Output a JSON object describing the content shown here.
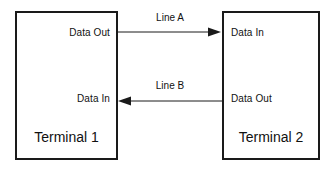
{
  "diagram": {
    "title_text": "",
    "background_color": "#ffffff",
    "stroke_color": "#1a1a1a",
    "terminals": [
      {
        "id": "terminal-1",
        "title": "Terminal 1",
        "ports": [
          {
            "id": "t1-data-out",
            "label": "Data Out",
            "align": "right"
          },
          {
            "id": "t1-data-in",
            "label": "Data In",
            "align": "right"
          }
        ]
      },
      {
        "id": "terminal-2",
        "title": "Terminal 2",
        "ports": [
          {
            "id": "t2-data-in",
            "label": "Data In",
            "align": "left"
          },
          {
            "id": "t2-data-out",
            "label": "Data Out",
            "align": "left"
          }
        ]
      }
    ],
    "connections": [
      {
        "id": "line-a",
        "label": "Line A",
        "from": "terminal-1 Data Out",
        "to": "terminal-2 Data In",
        "direction": "left-to-right"
      },
      {
        "id": "line-b",
        "label": "Line B",
        "from": "terminal-2 Data Out",
        "to": "terminal-1 Data In",
        "direction": "right-to-left"
      }
    ]
  }
}
